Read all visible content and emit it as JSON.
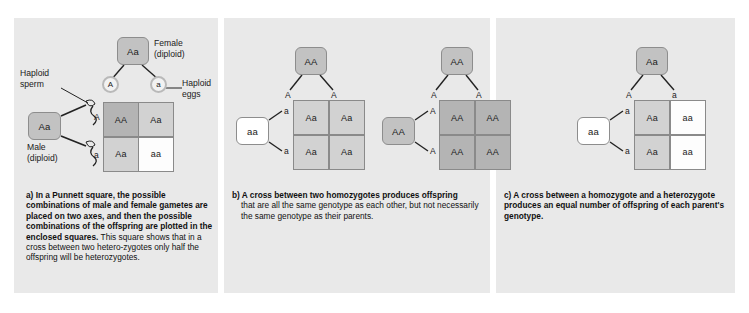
{
  "figure": {
    "background": "#ffffff",
    "panel_background": "#e9e9e9"
  },
  "colors": {
    "box_gray": "#c2c2c2",
    "box_white": "#ffffff",
    "cell_dark": "#b4b4b4",
    "cell_gray": "#d2d2d2",
    "cell_white": "#fdfdfd",
    "outline": "#8a8a8a",
    "text": "#1a1a1a"
  },
  "panel_a": {
    "letter": "a)",
    "female_parent": {
      "genotype": "Aa",
      "shade": "gray"
    },
    "female_label": "Female\n(diploid)",
    "male_parent": {
      "genotype": "Aa",
      "shade": "gray"
    },
    "male_label": "Male\n(diploid)",
    "haploid_sperm_label": "Haploid\nsperm",
    "haploid_eggs_label": "Haploid\neggs",
    "egg_alleles": [
      "A",
      "a"
    ],
    "sperm_alleles": [
      "A",
      "a"
    ],
    "column_alleles": [
      "A",
      "a"
    ],
    "row_alleles": [
      "A",
      "a"
    ],
    "cells": [
      {
        "genotype": "AA",
        "shade": "dark"
      },
      {
        "genotype": "Aa",
        "shade": "gray"
      },
      {
        "genotype": "Aa",
        "shade": "gray"
      },
      {
        "genotype": "aa",
        "shade": "white"
      }
    ],
    "caption_bold": "a) In a Punnett square, the possible combinations of male and female gametes are placed on two axes, and then the possible combinations of the offspring are plotted in the enclosed squares.",
    "caption_rest": " This square shows that in a cross between two hetero-zygotes only half the offspring will be heterozygotes."
  },
  "panel_b": {
    "letter": "b)",
    "cross_1": {
      "top_parent": {
        "genotype": "AA",
        "shade": "gray"
      },
      "left_parent": {
        "genotype": "aa",
        "shade": "white"
      },
      "column_alleles": [
        "A",
        "A"
      ],
      "row_alleles": [
        "a",
        "a"
      ],
      "cells": [
        {
          "genotype": "Aa",
          "shade": "gray"
        },
        {
          "genotype": "Aa",
          "shade": "gray"
        },
        {
          "genotype": "Aa",
          "shade": "gray"
        },
        {
          "genotype": "Aa",
          "shade": "gray"
        }
      ]
    },
    "cross_2": {
      "top_parent": {
        "genotype": "AA",
        "shade": "gray"
      },
      "left_parent": {
        "genotype": "AA",
        "shade": "gray"
      },
      "column_alleles": [
        "A",
        "A"
      ],
      "row_alleles": [
        "A",
        "A"
      ],
      "cells": [
        {
          "genotype": "AA",
          "shade": "dark"
        },
        {
          "genotype": "AA",
          "shade": "dark"
        },
        {
          "genotype": "AA",
          "shade": "dark"
        },
        {
          "genotype": "AA",
          "shade": "dark"
        }
      ]
    },
    "caption_bold": "b) A cross between two homozygotes produces offspring",
    "caption_rest": "that are all the same genotype as each other, but not necessarily the same genotype as their parents."
  },
  "panel_c": {
    "letter": "c)",
    "top_parent": {
      "genotype": "Aa",
      "shade": "gray"
    },
    "left_parent": {
      "genotype": "aa",
      "shade": "white"
    },
    "column_alleles": [
      "A",
      "a"
    ],
    "row_alleles": [
      "a",
      "a"
    ],
    "cells": [
      {
        "genotype": "Aa",
        "shade": "gray"
      },
      {
        "genotype": "aa",
        "shade": "white"
      },
      {
        "genotype": "Aa",
        "shade": "gray"
      },
      {
        "genotype": "aa",
        "shade": "white"
      }
    ],
    "caption_bold": "c) A cross between a homozygote and a heterozygote produces an equal number of offspring of each parent's genotype.",
    "caption_rest": ""
  }
}
